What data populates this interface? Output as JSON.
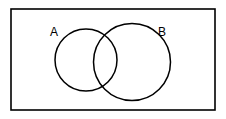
{
  "figure": {
    "kind": "venn-diagram",
    "title": "",
    "background_color": "#ffffff",
    "stroke_color": "#000000",
    "fill_color": "none",
    "width": 226,
    "height": 119
  },
  "universe": {
    "name": "universal-set-rectangle",
    "label": "",
    "x": 11,
    "y": 9,
    "width": 204,
    "height": 101,
    "stroke_width": 1.6
  },
  "sets": [
    {
      "id": "A",
      "label": "A",
      "cx": 86,
      "cy": 60,
      "r": 31,
      "stroke_width": 1.5,
      "label_x": 54,
      "label_y": 33
    },
    {
      "id": "B",
      "label": "B",
      "cx": 132,
      "cy": 62,
      "r": 38.5,
      "stroke_width": 1.5,
      "label_x": 162,
      "label_y": 33
    }
  ],
  "regions": {
    "intersection_label": "",
    "a_only_label": "",
    "b_only_label": "",
    "outside_label": ""
  },
  "chart_data": {
    "type": "venn",
    "title": "",
    "sets": [
      "A",
      "B"
    ],
    "shaded": false,
    "overlap": true,
    "notes": ""
  }
}
